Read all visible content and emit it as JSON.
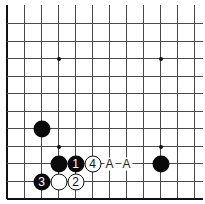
{
  "diagram": {
    "type": "go-board-diagram",
    "visible_columns": 12,
    "visible_rows": 11,
    "edges": [
      "left",
      "bottom"
    ],
    "colors": {
      "line": "#4a4a4a",
      "black_stone": "#0a0a0a",
      "white_stone": "#ffffff"
    },
    "star_points": [
      {
        "col": 3,
        "row": 2
      },
      {
        "col": 9,
        "row": 2
      },
      {
        "col": 3,
        "row": 7
      },
      {
        "col": 9,
        "row": 7
      }
    ],
    "stones": [
      {
        "color": "black",
        "col": 2,
        "row": 6,
        "label": ""
      },
      {
        "color": "black",
        "col": 3,
        "row": 8,
        "label": ""
      },
      {
        "color": "black",
        "col": 4,
        "row": 8,
        "label": "1"
      },
      {
        "color": "white",
        "col": 5,
        "row": 8,
        "label": "4"
      },
      {
        "color": "black",
        "col": 9,
        "row": 8,
        "label": ""
      },
      {
        "color": "black",
        "col": 2,
        "row": 9,
        "label": "3"
      },
      {
        "color": "white",
        "col": 3,
        "row": 9,
        "label": ""
      },
      {
        "color": "white",
        "col": 4,
        "row": 9,
        "label": "2"
      }
    ],
    "markers": [
      {
        "col": 6,
        "row": 8,
        "text": "A"
      },
      {
        "col": 7,
        "row": 8,
        "text": "A"
      }
    ]
  }
}
